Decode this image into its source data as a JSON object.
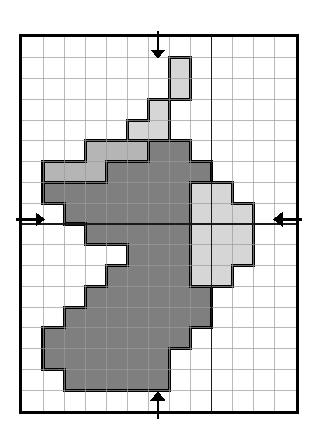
{
  "figure": {
    "type": "raster-grid-diagram"
  },
  "grid": {
    "columns": 13,
    "rows": 18,
    "cell_size_px": 21.1,
    "origin_x_px": 22,
    "origin_y_px": 37,
    "width_px": 274,
    "height_px": 374,
    "minor_line_color": "#9a9a9a",
    "minor_line_width_px": 0.7,
    "major_line_color": "#1a1a1a",
    "major_line_width_px": 1.6,
    "frame_color": "#000000",
    "frame_width_px": 3,
    "major_vertical_lines_at_column": [
      9
    ],
    "major_horizontal_lines_at_row": [
      9
    ],
    "background": "#ffffff"
  },
  "legend": {
    "classes": [
      {
        "name": "core-dark",
        "label": "Dark grey class",
        "color": "#7f7f7f"
      },
      {
        "name": "edge-mid",
        "label": "Mid grey class",
        "color": "#b5b5b5"
      },
      {
        "name": "fill-light",
        "label": "Light grey class",
        "color": "#d6d6d6"
      },
      {
        "name": "empty",
        "label": "Unfilled cell",
        "color": "#ffffff"
      }
    ],
    "outline_color": "#000000",
    "outline_width_px": 3.2
  },
  "arrows": {
    "color": "#000000",
    "items": [
      {
        "name": "arrow-top",
        "direction": "down",
        "axis": "vertical",
        "at_column": 6.45,
        "tail_outside": true
      },
      {
        "name": "arrow-bottom",
        "direction": "up",
        "axis": "vertical",
        "at_column": 6.45,
        "tail_outside": true
      },
      {
        "name": "arrow-left",
        "direction": "right",
        "axis": "horizontal",
        "at_row": 8.78,
        "tail_outside": true
      },
      {
        "name": "arrow-right",
        "direction": "left",
        "axis": "horizontal",
        "at_row": 8.78,
        "tail_outside": true
      }
    ]
  },
  "raster_cells": {
    "note": "Each entry is [column, row, class]; column 0 is leftmost, row 0 is topmost.",
    "cells": [
      [
        7,
        1,
        "fill-light"
      ],
      [
        7,
        2,
        "fill-light"
      ],
      [
        6,
        3,
        "fill-light"
      ],
      [
        5,
        4,
        "fill-light"
      ],
      [
        6,
        4,
        "fill-light"
      ],
      [
        3,
        5,
        "edge-mid"
      ],
      [
        4,
        5,
        "edge-mid"
      ],
      [
        5,
        5,
        "edge-mid"
      ],
      [
        6,
        5,
        "core-dark"
      ],
      [
        7,
        5,
        "core-dark"
      ],
      [
        1,
        6,
        "edge-mid"
      ],
      [
        2,
        6,
        "edge-mid"
      ],
      [
        3,
        6,
        "edge-mid"
      ],
      [
        4,
        6,
        "core-dark"
      ],
      [
        5,
        6,
        "core-dark"
      ],
      [
        6,
        6,
        "core-dark"
      ],
      [
        7,
        6,
        "core-dark"
      ],
      [
        8,
        6,
        "core-dark"
      ],
      [
        1,
        7,
        "core-dark"
      ],
      [
        2,
        7,
        "core-dark"
      ],
      [
        3,
        7,
        "core-dark"
      ],
      [
        4,
        7,
        "core-dark"
      ],
      [
        5,
        7,
        "core-dark"
      ],
      [
        6,
        7,
        "core-dark"
      ],
      [
        7,
        7,
        "core-dark"
      ],
      [
        8,
        7,
        "fill-light"
      ],
      [
        9,
        7,
        "fill-light"
      ],
      [
        2,
        8,
        "core-dark"
      ],
      [
        3,
        8,
        "core-dark"
      ],
      [
        4,
        8,
        "core-dark"
      ],
      [
        5,
        8,
        "core-dark"
      ],
      [
        6,
        8,
        "core-dark"
      ],
      [
        7,
        8,
        "core-dark"
      ],
      [
        8,
        8,
        "fill-light"
      ],
      [
        9,
        8,
        "fill-light"
      ],
      [
        10,
        8,
        "fill-light"
      ],
      [
        3,
        9,
        "core-dark"
      ],
      [
        4,
        9,
        "core-dark"
      ],
      [
        5,
        9,
        "core-dark"
      ],
      [
        6,
        9,
        "core-dark"
      ],
      [
        7,
        9,
        "core-dark"
      ],
      [
        8,
        9,
        "fill-light"
      ],
      [
        9,
        9,
        "fill-light"
      ],
      [
        10,
        9,
        "fill-light"
      ],
      [
        5,
        10,
        "core-dark"
      ],
      [
        6,
        10,
        "core-dark"
      ],
      [
        7,
        10,
        "core-dark"
      ],
      [
        8,
        10,
        "fill-light"
      ],
      [
        9,
        10,
        "fill-light"
      ],
      [
        10,
        10,
        "fill-light"
      ],
      [
        4,
        11,
        "core-dark"
      ],
      [
        5,
        11,
        "core-dark"
      ],
      [
        6,
        11,
        "core-dark"
      ],
      [
        7,
        11,
        "core-dark"
      ],
      [
        8,
        11,
        "fill-light"
      ],
      [
        9,
        11,
        "fill-light"
      ],
      [
        3,
        12,
        "core-dark"
      ],
      [
        4,
        12,
        "core-dark"
      ],
      [
        5,
        12,
        "core-dark"
      ],
      [
        6,
        12,
        "core-dark"
      ],
      [
        7,
        12,
        "core-dark"
      ],
      [
        8,
        12,
        "core-dark"
      ],
      [
        2,
        13,
        "core-dark"
      ],
      [
        3,
        13,
        "core-dark"
      ],
      [
        4,
        13,
        "core-dark"
      ],
      [
        5,
        13,
        "core-dark"
      ],
      [
        6,
        13,
        "core-dark"
      ],
      [
        7,
        13,
        "core-dark"
      ],
      [
        8,
        13,
        "core-dark"
      ],
      [
        1,
        14,
        "core-dark"
      ],
      [
        2,
        14,
        "core-dark"
      ],
      [
        3,
        14,
        "core-dark"
      ],
      [
        4,
        14,
        "core-dark"
      ],
      [
        5,
        14,
        "core-dark"
      ],
      [
        6,
        14,
        "core-dark"
      ],
      [
        7,
        14,
        "core-dark"
      ],
      [
        1,
        15,
        "core-dark"
      ],
      [
        2,
        15,
        "core-dark"
      ],
      [
        3,
        15,
        "core-dark"
      ],
      [
        4,
        15,
        "core-dark"
      ],
      [
        5,
        15,
        "core-dark"
      ],
      [
        6,
        15,
        "core-dark"
      ],
      [
        2,
        16,
        "core-dark"
      ],
      [
        3,
        16,
        "core-dark"
      ],
      [
        4,
        16,
        "core-dark"
      ],
      [
        5,
        16,
        "core-dark"
      ],
      [
        6,
        16,
        "core-dark"
      ]
    ]
  }
}
